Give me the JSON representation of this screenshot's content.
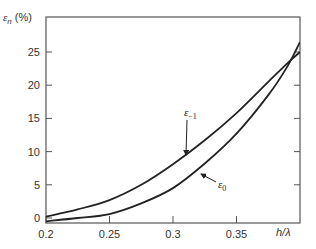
{
  "chart_data": {
    "type": "line",
    "title": "",
    "xlabel": "h/λ",
    "ylabel": "ε_n (%)",
    "xlim": [
      0.2,
      0.4
    ],
    "ylim": [
      -0.8,
      27.5
    ],
    "grid": false,
    "legend": "none (inline arrow labels)",
    "x_ticks": [
      0.2,
      0.25,
      0.3,
      0.35
    ],
    "x_tick_labels": [
      "0.2",
      "0.25",
      "0.3",
      "0.35"
    ],
    "y_ticks": [
      0,
      5,
      10,
      15,
      20,
      25
    ],
    "y_tick_labels": [
      "0",
      "5",
      "10",
      "15",
      "20",
      "25"
    ],
    "series": [
      {
        "name": "ε_-1",
        "label_main": "ε",
        "label_sub": "−1",
        "x": [
          0.2,
          0.225,
          0.25,
          0.275,
          0.3,
          0.325,
          0.35,
          0.375,
          0.39,
          0.4
        ],
        "values": [
          0.2,
          1.3,
          2.7,
          5.0,
          8.1,
          11.7,
          15.8,
          20.5,
          23.3,
          25.0
        ]
      },
      {
        "name": "ε_0",
        "label_main": "ε",
        "label_sub": "0",
        "x": [
          0.2,
          0.225,
          0.25,
          0.275,
          0.3,
          0.325,
          0.35,
          0.375,
          0.39,
          0.4
        ],
        "values": [
          -0.5,
          0.0,
          0.6,
          2.2,
          4.5,
          8.2,
          12.7,
          18.5,
          22.8,
          26.5
        ]
      }
    ],
    "annotations": [
      {
        "text": "ε−1",
        "points_to_series": "ε_-1",
        "at_x": 0.31
      },
      {
        "text": "ε0",
        "points_to_series": "ε_0",
        "at_x": 0.322
      }
    ]
  }
}
